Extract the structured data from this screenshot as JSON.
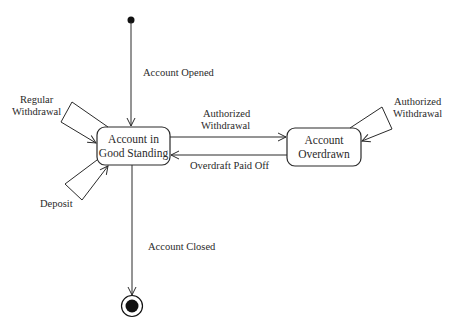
{
  "diagram": {
    "type": "uml-state-machine",
    "states": [
      {
        "id": "good",
        "line1": "Account in",
        "line2": "Good Standing"
      },
      {
        "id": "overdrawn",
        "line1": "Account",
        "line2": "Overdrawn"
      }
    ],
    "pseudostates": {
      "initial": "initial-state",
      "final": "final-state"
    },
    "transitions": {
      "opened": "Account Opened",
      "regular_withdrawal": {
        "line1": "Regular",
        "line2": "Withdrawal"
      },
      "deposit": "Deposit",
      "authorized_withdrawal": {
        "line1": "Authorized",
        "line2": "Withdrawal"
      },
      "overdraft_paid_off": "Overdraft Paid Off",
      "authorized_withdrawal_self": {
        "line1": "Authorized",
        "line2": "Withdrawal"
      },
      "closed": "Account Closed"
    },
    "colors": {
      "stroke": "#2a2a2a",
      "background": "#ffffff"
    }
  }
}
